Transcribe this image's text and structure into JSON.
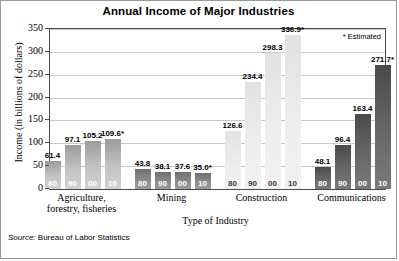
{
  "title": "Annual Income of Major Industries",
  "estimated_note": "* Estimated",
  "source_label": "Source:",
  "source_text": "Bureau of Labor Statistics",
  "chart_data": {
    "type": "bar",
    "title": "Annual Income of Major Industries",
    "xlabel": "Type of Industry",
    "ylabel": "Income (in billions of dollars)",
    "ylim": [
      0,
      350
    ],
    "yticks": [
      0,
      50,
      100,
      150,
      200,
      250,
      300,
      350
    ],
    "ytick_labels": [
      "0",
      "50",
      "100",
      "150",
      "200",
      "250",
      "300",
      "350"
    ],
    "grid": true,
    "legend": "none",
    "annotations": [
      "* Estimated"
    ],
    "source": "Source: Bureau of Labor Statistics",
    "categories": [
      "Agriculture, forestry, fisheries",
      "Mining",
      "Construction",
      "Communications"
    ],
    "subcategories": [
      "80",
      "90",
      "00",
      "10"
    ],
    "groups": [
      {
        "label_line1": "Agriculture,",
        "label_line2": "forestry, fisheries",
        "shade": "shade-a",
        "bars": [
          {
            "year": "80",
            "value": 61.4,
            "label": "61.4",
            "estimated": false
          },
          {
            "year": "90",
            "value": 97.1,
            "label": "97.1",
            "estimated": false
          },
          {
            "year": "00",
            "value": 105.2,
            "label": "105.2",
            "estimated": false
          },
          {
            "year": "10",
            "value": 109.6,
            "label": "109.6*",
            "estimated": true
          }
        ]
      },
      {
        "label_line1": "Mining",
        "label_line2": "",
        "shade": "shade-b",
        "bars": [
          {
            "year": "80",
            "value": 43.8,
            "label": "43.8",
            "estimated": false
          },
          {
            "year": "90",
            "value": 38.1,
            "label": "38.1",
            "estimated": false
          },
          {
            "year": "00",
            "value": 37.6,
            "label": "37.6",
            "estimated": false
          },
          {
            "year": "10",
            "value": 35.0,
            "label": "35.0*",
            "estimated": true
          }
        ]
      },
      {
        "label_line1": "Construction",
        "label_line2": "",
        "shade": "shade-c",
        "bars": [
          {
            "year": "80",
            "value": 126.6,
            "label": "126.6",
            "estimated": false
          },
          {
            "year": "90",
            "value": 234.4,
            "label": "234.4",
            "estimated": false
          },
          {
            "year": "00",
            "value": 298.3,
            "label": "298.3",
            "estimated": false
          },
          {
            "year": "10",
            "value": 336.9,
            "label": "336.9*",
            "estimated": true
          }
        ]
      },
      {
        "label_line1": "Communications",
        "label_line2": "",
        "shade": "shade-d",
        "bars": [
          {
            "year": "80",
            "value": 48.1,
            "label": "48.1",
            "estimated": false
          },
          {
            "year": "90",
            "value": 96.4,
            "label": "96.4",
            "estimated": false
          },
          {
            "year": "00",
            "value": 163.4,
            "label": "163.4",
            "estimated": false
          },
          {
            "year": "10",
            "value": 271.7,
            "label": "271.7*",
            "estimated": true
          }
        ]
      }
    ]
  }
}
